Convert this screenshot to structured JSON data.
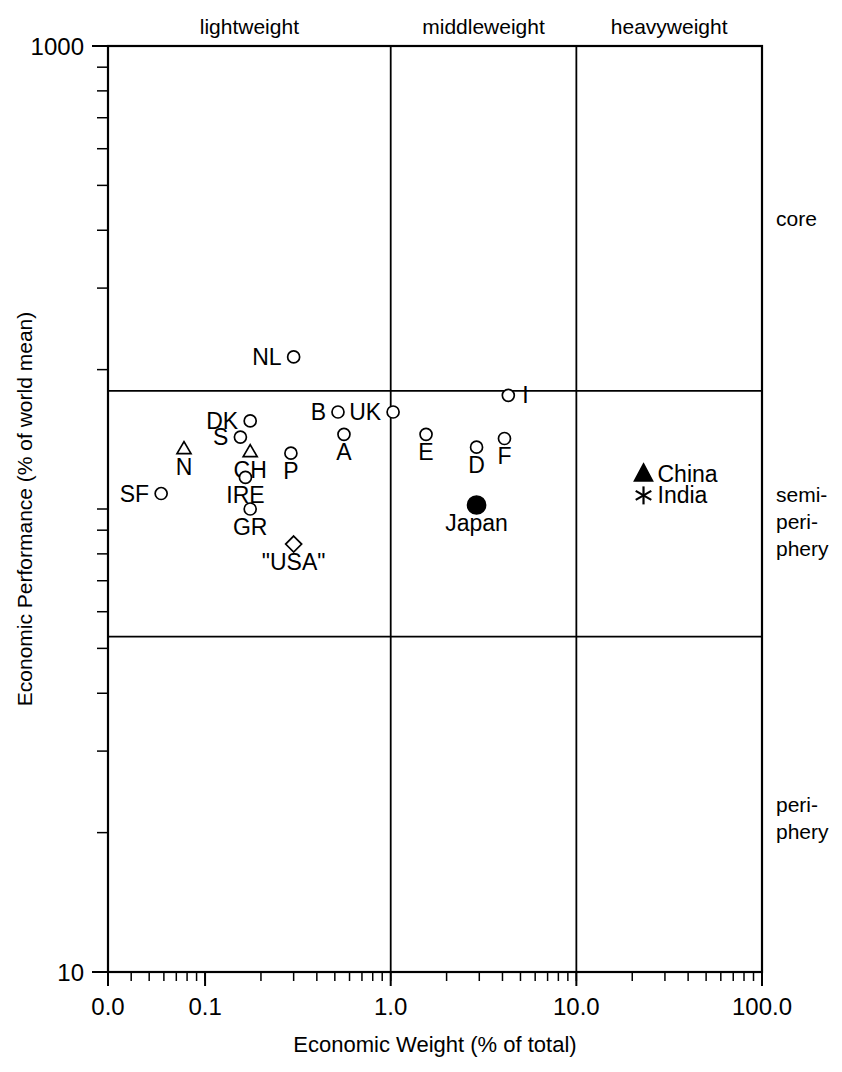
{
  "chart_data": {
    "type": "scatter",
    "title": "",
    "xlabel": "Economic Weight (% of total)",
    "ylabel": "Economic Performance (% of world mean)",
    "xscale": "log",
    "yscale": "log",
    "xlim": [
      0.03,
      100.0
    ],
    "ylim": [
      10,
      1000
    ],
    "xticks": [
      "0.0",
      "0.1",
      "1.0",
      "10.0",
      "100.0"
    ],
    "xtick_values": [
      0.03,
      0.1,
      1.0,
      10.0,
      100.0
    ],
    "yticks": [
      "1000",
      "10"
    ],
    "ytick_values": [
      1000,
      10
    ],
    "grid": false,
    "legend": "none",
    "column_bands": [
      {
        "label": "lightweight",
        "x_range": [
          0.03,
          1.0
        ]
      },
      {
        "label": "middleweight",
        "x_range": [
          1.0,
          10.0
        ]
      },
      {
        "label": "heavyweight",
        "x_range": [
          10.0,
          100.0
        ]
      }
    ],
    "row_bands": [
      {
        "label": "core",
        "y_range": [
          180,
          1000
        ]
      },
      {
        "label": "semi-periphery",
        "y_range": [
          53,
          180
        ]
      },
      {
        "label": "periphery",
        "y_range": [
          10,
          53
        ]
      }
    ],
    "points": [
      {
        "label": "NL",
        "x": 0.3,
        "y": 213,
        "marker": "circle-open",
        "label_pos": "left"
      },
      {
        "label": "I",
        "x": 4.3,
        "y": 176,
        "marker": "circle-open",
        "label_pos": "right"
      },
      {
        "label": "B",
        "x": 0.52,
        "y": 162,
        "marker": "circle-open",
        "label_pos": "left"
      },
      {
        "label": "UK",
        "x": 1.03,
        "y": 162,
        "marker": "circle-open",
        "label_pos": "left"
      },
      {
        "label": "DK",
        "x": 0.175,
        "y": 155,
        "marker": "circle-open",
        "label_pos": "left"
      },
      {
        "label": "A",
        "x": 0.56,
        "y": 145,
        "marker": "circle-open",
        "label_pos": "below"
      },
      {
        "label": "E",
        "x": 1.55,
        "y": 145,
        "marker": "circle-open",
        "label_pos": "below"
      },
      {
        "label": "F",
        "x": 4.1,
        "y": 142,
        "marker": "circle-open",
        "label_pos": "below"
      },
      {
        "label": "S",
        "x": 0.155,
        "y": 143,
        "marker": "circle-open",
        "label_pos": "left"
      },
      {
        "label": "D",
        "x": 2.9,
        "y": 136,
        "marker": "circle-open",
        "label_pos": "below"
      },
      {
        "label": "N",
        "x": 0.077,
        "y": 135,
        "marker": "triangle-open",
        "label_pos": "below"
      },
      {
        "label": "CH",
        "x": 0.175,
        "y": 133,
        "marker": "triangle-open",
        "label_pos": "below"
      },
      {
        "label": "P",
        "x": 0.29,
        "y": 132,
        "marker": "circle-open",
        "label_pos": "below"
      },
      {
        "label": "China",
        "x": 23.0,
        "y": 119,
        "marker": "triangle-filled",
        "label_pos": "right"
      },
      {
        "label": "IRE",
        "x": 0.165,
        "y": 117,
        "marker": "circle-open",
        "label_pos": "below"
      },
      {
        "label": "India",
        "x": 23.0,
        "y": 107,
        "marker": "star",
        "label_pos": "right"
      },
      {
        "label": "SF",
        "x": 0.058,
        "y": 108,
        "marker": "circle-open",
        "label_pos": "left"
      },
      {
        "label": "Japan",
        "x": 2.9,
        "y": 102,
        "marker": "circle-filled",
        "label_pos": "below"
      },
      {
        "label": "GR",
        "x": 0.175,
        "y": 100,
        "marker": "circle-open",
        "label_pos": "below"
      },
      {
        "label": "\"USA\"",
        "x": 0.3,
        "y": 84,
        "marker": "diamond-open",
        "label_pos": "below"
      }
    ]
  },
  "axes": {
    "x_label": "Economic Weight (% of total)",
    "y_label": "Economic Performance (% of world mean)",
    "x_tick_labels": [
      "0.0",
      "0.1",
      "1.0",
      "10.0",
      "100.0"
    ],
    "y_tick_top": "1000",
    "y_tick_bottom": "10"
  },
  "bands": {
    "top": [
      "lightweight",
      "middleweight",
      "heavyweight"
    ],
    "right": [
      "core",
      "semi-",
      "peri-",
      "phery",
      "peri-",
      "phery"
    ],
    "right_core": "core",
    "right_semi_1": "semi-",
    "right_semi_2": "peri-",
    "right_semi_3": "phery",
    "right_peri_1": "peri-",
    "right_peri_2": "phery"
  },
  "colors": {
    "ink": "#000000",
    "background": "#ffffff"
  }
}
